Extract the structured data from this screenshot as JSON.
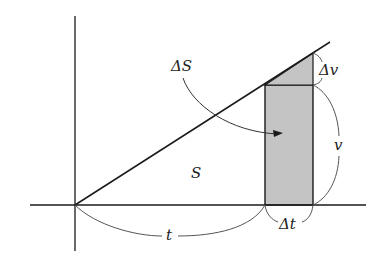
{
  "diagram": {
    "labels": {
      "delta_s": "ΔS",
      "s": "S",
      "delta_v": "Δv",
      "v": "v",
      "delta_t": "Δt",
      "t": "t"
    },
    "colors": {
      "line": "#1a1a1a",
      "fill": "#c4c4c4",
      "brace": "#555555",
      "background": "#ffffff"
    }
  }
}
